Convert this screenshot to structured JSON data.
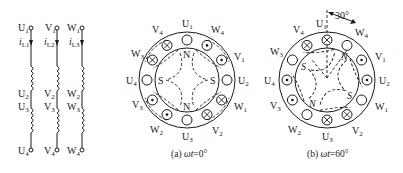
{
  "windings": [
    {
      "phase": "U",
      "top": "U",
      "top_sub": "1",
      "current": "i",
      "current_sub": "L1",
      "mid1": "U",
      "mid1_sub": "2",
      "mid2": "U",
      "mid2_sub": "3",
      "bottom": "U",
      "bottom_sub": "4"
    },
    {
      "phase": "V",
      "top": "V",
      "top_sub": "1",
      "current": "i",
      "current_sub": "L2",
      "mid1": "V",
      "mid1_sub": "2",
      "mid2": "V",
      "mid2_sub": "3",
      "bottom": "V",
      "bottom_sub": "4"
    },
    {
      "phase": "W",
      "top": "W",
      "top_sub": "1",
      "current": "i",
      "current_sub": "L3",
      "mid1": "W",
      "mid1_sub": "2",
      "mid2": "W",
      "mid2_sub": "3",
      "bottom": "W",
      "bottom_sub": "4"
    }
  ],
  "diagram_a": {
    "caption_prefix": "(a) ",
    "caption_var": "ωt",
    "caption_value": "=0°",
    "labels": {
      "top": [
        "U",
        "1"
      ],
      "top_left": [
        "V",
        "4"
      ],
      "top_right": [
        "W",
        "4"
      ],
      "upper_left": [
        "W",
        "3"
      ],
      "upper_right": [
        "V",
        "1"
      ],
      "left": [
        "U",
        "4"
      ],
      "right": [
        "U",
        "2"
      ],
      "lower_left": [
        "V",
        "3"
      ],
      "lower_right": [
        "W",
        "1"
      ],
      "bottom_left": [
        "W",
        "2"
      ],
      "bottom_right": [
        "V",
        "2"
      ],
      "bottom": [
        "U",
        "3"
      ]
    },
    "slots": [
      "empty",
      "dot",
      "dot",
      "empty",
      "cross",
      "cross",
      "empty",
      "dot",
      "dot",
      "empty",
      "cross",
      "cross"
    ],
    "poles": {
      "top": "N",
      "bottom": "N",
      "left": "S",
      "right": "S"
    }
  },
  "diagram_b": {
    "caption_prefix": "(b) ",
    "caption_var": "ωt",
    "caption_value": "=60°",
    "angle_label": "30°",
    "labels": {
      "top": [
        "U",
        "1"
      ],
      "top_left": [
        "V",
        "4"
      ],
      "top_right": [
        "W",
        "4"
      ],
      "upper_left": [
        "W",
        "3"
      ],
      "upper_right": [
        "V",
        "1"
      ],
      "left": [
        "U",
        "4"
      ],
      "right": [
        "U",
        "2"
      ],
      "lower_left": [
        "V",
        "3"
      ],
      "lower_right": [
        "W",
        "1"
      ],
      "bottom_left": [
        "W",
        "2"
      ],
      "bottom_right": [
        "V",
        "2"
      ],
      "bottom": [
        "U",
        "3"
      ]
    },
    "slots": [
      "cross",
      "empty",
      "dot",
      "dot",
      "empty",
      "cross",
      "cross",
      "empty",
      "dot",
      "dot",
      "empty",
      "cross"
    ],
    "poles": {
      "n1": "N",
      "n2": "N",
      "s1": "S",
      "s2": "S"
    }
  }
}
